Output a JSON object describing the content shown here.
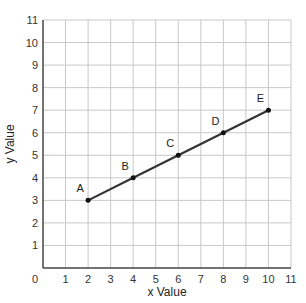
{
  "chart_data": {
    "type": "line",
    "title": "",
    "xlabel": "x Value",
    "ylabel": "y Value",
    "xlim": [
      0,
      11
    ],
    "ylim": [
      0,
      11
    ],
    "grid": true,
    "x_ticks": [
      "0",
      "1",
      "2",
      "3",
      "4",
      "5",
      "6",
      "7",
      "8",
      "9",
      "10",
      "11"
    ],
    "y_ticks": [
      "1",
      "2",
      "3",
      "4",
      "5",
      "6",
      "7",
      "8",
      "9",
      "10",
      "11"
    ],
    "series": [
      {
        "name": "line",
        "color": "#333333",
        "points": [
          {
            "label": "A",
            "x": 2,
            "y": 3
          },
          {
            "label": "B",
            "x": 4,
            "y": 4
          },
          {
            "label": "C",
            "x": 6,
            "y": 5
          },
          {
            "label": "D",
            "x": 8,
            "y": 6
          },
          {
            "label": "E",
            "x": 10,
            "y": 7
          }
        ]
      }
    ]
  }
}
